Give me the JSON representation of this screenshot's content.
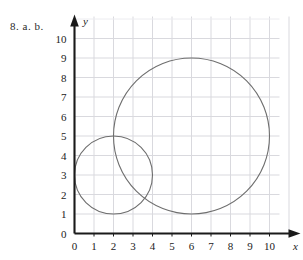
{
  "figure": {
    "problem_label": "8. a. b.",
    "background_color": "#ffffff",
    "grid_color": "#d9d9de",
    "axis_color": "#1a1a1a",
    "curve_color": "#6e6e6e"
  },
  "chart_data": {
    "type": "scatter",
    "title": "",
    "subtitle": "",
    "xlabel": "x",
    "ylabel": "y",
    "xlim": [
      0,
      10
    ],
    "ylim": [
      0,
      10
    ],
    "grid": true,
    "legend": "none",
    "x_ticks": [
      "0",
      "1",
      "2",
      "3",
      "4",
      "5",
      "6",
      "7",
      "8",
      "9",
      "10"
    ],
    "y_ticks": [
      "0",
      "1",
      "2",
      "3",
      "4",
      "5",
      "6",
      "7",
      "8",
      "9",
      "10"
    ],
    "x_tick_values": [
      0,
      1,
      2,
      3,
      4,
      5,
      6,
      7,
      8,
      9,
      10
    ],
    "y_tick_values": [
      0,
      1,
      2,
      3,
      4,
      5,
      6,
      7,
      8,
      9,
      10
    ],
    "series": [
      {
        "name": "small-circle",
        "shape": "circle",
        "center_x": 2,
        "center_y": 3,
        "radius": 2,
        "color": "#6e6e6e",
        "x_range": [
          0,
          4
        ],
        "y_range": [
          1,
          5
        ]
      },
      {
        "name": "large-circle",
        "shape": "circle",
        "center_x": 6,
        "center_y": 5,
        "radius": 4,
        "color": "#6e6e6e",
        "x_range": [
          2,
          10
        ],
        "y_range": [
          1,
          9
        ]
      }
    ],
    "annotations": []
  },
  "axes": {
    "x_axis_label": "x",
    "y_axis_label": "y",
    "x_ticks": [
      {
        "label": "0",
        "value": 0
      },
      {
        "label": "1",
        "value": 1
      },
      {
        "label": "2",
        "value": 2
      },
      {
        "label": "3",
        "value": 3
      },
      {
        "label": "4",
        "value": 4
      },
      {
        "label": "5",
        "value": 5
      },
      {
        "label": "6",
        "value": 6
      },
      {
        "label": "7",
        "value": 7
      },
      {
        "label": "8",
        "value": 8
      },
      {
        "label": "9",
        "value": 9
      },
      {
        "label": "10",
        "value": 10
      }
    ],
    "y_ticks": [
      {
        "label": "0",
        "value": 0
      },
      {
        "label": "1",
        "value": 1
      },
      {
        "label": "2",
        "value": 2
      },
      {
        "label": "3",
        "value": 3
      },
      {
        "label": "4",
        "value": 4
      },
      {
        "label": "5",
        "value": 5
      },
      {
        "label": "6",
        "value": 6
      },
      {
        "label": "7",
        "value": 7
      },
      {
        "label": "8",
        "value": 8
      },
      {
        "label": "9",
        "value": 9
      },
      {
        "label": "10",
        "value": 10
      }
    ]
  }
}
